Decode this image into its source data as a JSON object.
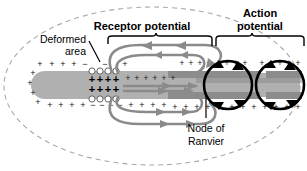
{
  "figure": {
    "title_top_left": "Receptor potential",
    "title_top_right_line1": "Action",
    "title_top_right_line2": "potential",
    "label_deformed_line1": "Deformed",
    "label_deformed_line2": "area",
    "label_node_line1": "Node of",
    "label_node_line2": "Ranvier"
  },
  "charges": {
    "plus": "+",
    "minus": "−",
    "top_row_outside": [
      "+",
      "+",
      "+",
      "+",
      "+",
      "−",
      "−",
      "−",
      "−",
      "+",
      "+",
      "+",
      "+",
      "+",
      "+",
      "+",
      "+",
      "+",
      "+",
      "+",
      "+",
      "+",
      "+",
      "+",
      "+",
      "+",
      "+",
      "+",
      "+",
      "+",
      "+",
      "+",
      "+"
    ],
    "bottom_row_outside": [
      "+",
      "+",
      "+",
      "+",
      "+",
      "−",
      "−",
      "−",
      "−",
      "+",
      "+",
      "+",
      "+",
      "+",
      "+",
      "+",
      "+",
      "+",
      "+",
      "+",
      "+",
      "+",
      "+",
      "+",
      "+",
      "+",
      "+",
      "+",
      "+",
      "+",
      "+",
      "+",
      "+"
    ],
    "left_edge_column": [
      "+",
      "+",
      "+",
      "+"
    ],
    "deformed_inner_rows": [
      [
        "+",
        "+",
        "+",
        "+"
      ],
      [
        "+",
        "+",
        "+",
        "+"
      ]
    ],
    "node_inner_plus_left": [
      "+",
      "+",
      "+",
      "+",
      "+",
      "+"
    ],
    "node_inner_plus_mid": [
      "+",
      "+",
      "+",
      "+",
      "+"
    ],
    "node_inner_plus_right": [
      "+",
      "+",
      "+",
      "+",
      "+"
    ]
  },
  "colors": {
    "axon_core": "#b0b0b0",
    "myelin": "#8c8c8c",
    "outline_dashed": "#a8a8a8",
    "current_gray": "#8a8a8a",
    "current_black": "#000000",
    "text": "#000000",
    "membrane_dot_fill": "#ffffff",
    "membrane_dot_stroke": "#555555",
    "background": "#ffffff"
  },
  "elements": {
    "dashed_ellipse": "dashed-ellipse-boundary",
    "axon": "axon-body",
    "deformed_region": "deformed-membrane-region",
    "receptor_loops": "receptor-current-loops",
    "action_loops": "action-current-loops",
    "node_gap": "node-of-ranvier-gap"
  }
}
